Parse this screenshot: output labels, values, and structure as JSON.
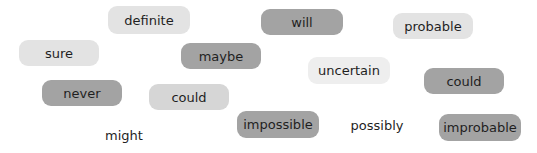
{
  "colors": {
    "dark": "#a3a3a3",
    "medium": "#d6d6d6",
    "light": "#e3e3e3",
    "lightest": "#eeeeee",
    "text": "#1f1f1f"
  },
  "words": [
    {
      "text": "definite",
      "style": "pill",
      "shade": "light",
      "x": 108,
      "y": 6,
      "w": 82,
      "h": 28
    },
    {
      "text": "will",
      "style": "pill",
      "shade": "dark",
      "x": 261,
      "y": 9,
      "w": 82,
      "h": 26
    },
    {
      "text": "probable",
      "style": "pill",
      "shade": "light",
      "x": 393,
      "y": 13,
      "w": 80,
      "h": 26
    },
    {
      "text": "sure",
      "style": "pill",
      "shade": "light",
      "x": 19,
      "y": 40,
      "w": 80,
      "h": 26
    },
    {
      "text": "maybe",
      "style": "pill",
      "shade": "dark",
      "x": 181,
      "y": 43,
      "w": 80,
      "h": 26
    },
    {
      "text": "uncertain",
      "style": "pill",
      "shade": "lightest",
      "x": 308,
      "y": 57,
      "w": 82,
      "h": 27
    },
    {
      "text": "could",
      "style": "pill",
      "shade": "dark",
      "x": 424,
      "y": 68,
      "w": 80,
      "h": 26
    },
    {
      "text": "never",
      "style": "pill",
      "shade": "dark",
      "x": 42,
      "y": 80,
      "w": 80,
      "h": 26
    },
    {
      "text": "could",
      "style": "pill",
      "shade": "medium",
      "x": 149,
      "y": 84,
      "w": 80,
      "h": 26
    },
    {
      "text": "impossible",
      "style": "pill",
      "shade": "dark",
      "x": 237,
      "y": 111,
      "w": 82,
      "h": 27
    },
    {
      "text": "possibly",
      "style": "plain",
      "shade": "none",
      "x": 350,
      "y": 114,
      "w": 54,
      "h": 22
    },
    {
      "text": "improbable",
      "style": "pill",
      "shade": "dark",
      "x": 439,
      "y": 114,
      "w": 82,
      "h": 27
    },
    {
      "text": "might",
      "style": "plain",
      "shade": "none",
      "x": 103,
      "y": 124,
      "w": 42,
      "h": 22
    }
  ]
}
